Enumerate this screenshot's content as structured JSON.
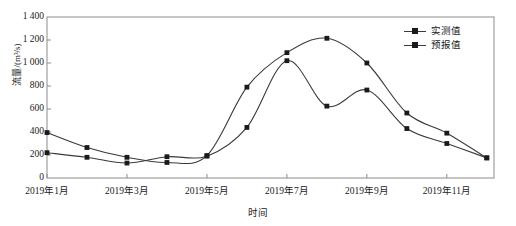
{
  "chart_data": {
    "type": "line",
    "title": "",
    "xlabel": "时间",
    "ylabel": "流量/(m³/s)",
    "ylim": [
      0,
      1400
    ],
    "yticks": [
      0,
      200,
      400,
      600,
      800,
      1000,
      1200,
      1400
    ],
    "ytick_labels": [
      "0",
      "200",
      "400",
      "600",
      "800",
      "1 000",
      "1 200",
      "1 400"
    ],
    "grid": false,
    "legend_position": "top-right",
    "x": [
      "2019年1月",
      "2019年2月",
      "2019年3月",
      "2019年4月",
      "2019年5月",
      "2019年6月",
      "2019年7月",
      "2019年8月",
      "2019年9月",
      "2019年10月",
      "2019年11月",
      "2019年12月"
    ],
    "xtick_labels": [
      "2019年1月",
      "2019年3月",
      "2019年5月",
      "2019年7月",
      "2019年9月",
      "2019年11月"
    ],
    "xtick_indices": [
      0,
      2,
      4,
      6,
      8,
      10
    ],
    "series": [
      {
        "name": "实测值",
        "color": "#3a3a3a",
        "marker": "square",
        "values": [
          220,
          180,
          130,
          185,
          190,
          440,
          1020,
          625,
          765,
          430,
          300,
          175
        ]
      },
      {
        "name": "预报值",
        "color": "#3a3a3a",
        "marker": "square",
        "values": [
          395,
          265,
          180,
          135,
          195,
          790,
          1090,
          1215,
          1000,
          565,
          390,
          175
        ]
      }
    ],
    "annotations": []
  },
  "legend": {
    "items": [
      {
        "label": "实测值"
      },
      {
        "label": "预报值"
      }
    ]
  },
  "axis": {
    "x_title": "时间",
    "y_title": "流量/(m³/s)"
  },
  "colors": {
    "line": "#3a3a3a",
    "marker": "#1a1a1a",
    "frame": "#8c8c8c",
    "text": "#1a1a1a",
    "background": "#ffffff"
  }
}
